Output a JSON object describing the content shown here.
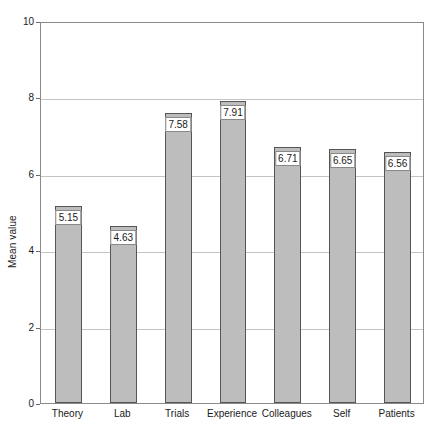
{
  "title_sliver": {
    "text": "•  •  •      •"
  },
  "chart_data": {
    "type": "bar",
    "title": "",
    "xlabel": "",
    "ylabel": "Mean value",
    "categories": [
      "Theory",
      "Lab",
      "Trials",
      "Experience",
      "Colleagues",
      "Self",
      "Patients"
    ],
    "values": [
      5.15,
      4.63,
      7.58,
      7.91,
      6.71,
      6.65,
      6.56
    ],
    "value_labels": [
      "5.15",
      "4.63",
      "7.58",
      "7.91",
      "6.71",
      "6.65",
      "6.56"
    ],
    "ylim": [
      0,
      10
    ],
    "yticks": [
      0,
      2,
      4,
      6,
      8,
      10
    ],
    "ytick_labels": [
      "0",
      "2",
      "4",
      "6",
      "8",
      "10"
    ],
    "grid": true,
    "grid_axis": "y",
    "legend": "none",
    "bar_color": "#bdbdbd",
    "bar_border_color": "#555555",
    "gridline_color": "#c4c4c4",
    "frame_color": "#8a8a8a",
    "background": "#ffffff"
  }
}
